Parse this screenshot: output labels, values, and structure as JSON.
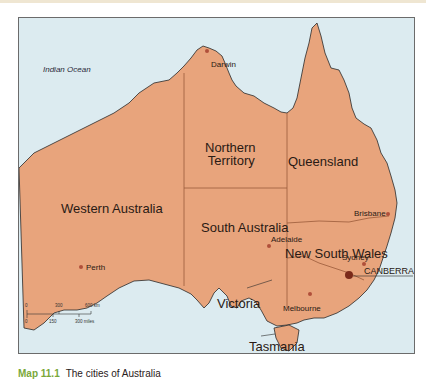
{
  "map": {
    "title": "The cities of Australia",
    "colors": {
      "land": "#e8a47c",
      "sea": "#dcebf0",
      "border": "#9a5a3a",
      "coast": "#2a2a2a",
      "city_dot": "#b0503a",
      "capital_dot": "#7a2a1a"
    },
    "ocean_label": "Indian Ocean",
    "states": [
      {
        "name": "Western Australia"
      },
      {
        "name": "Northern Territory",
        "line1": "Northern",
        "line2": "Territory"
      },
      {
        "name": "Queensland"
      },
      {
        "name": "South Australia"
      },
      {
        "name": "New South Wales"
      },
      {
        "name": "Victoria"
      },
      {
        "name": "Tasmania"
      }
    ],
    "cities": [
      {
        "name": "Darwin"
      },
      {
        "name": "Perth"
      },
      {
        "name": "Brisbane"
      },
      {
        "name": "Sydney"
      },
      {
        "name": "Adelaide"
      },
      {
        "name": "Melbourne"
      },
      {
        "name": "CANBERRA",
        "capital": true
      }
    ],
    "scale_bar": {
      "km_ticks": [
        "0",
        "300",
        "600 km"
      ],
      "mile_ticks": [
        "0",
        "150",
        "300 miles"
      ]
    }
  },
  "caption": {
    "number": "Map 11.1",
    "text": "The cities of Australia"
  }
}
